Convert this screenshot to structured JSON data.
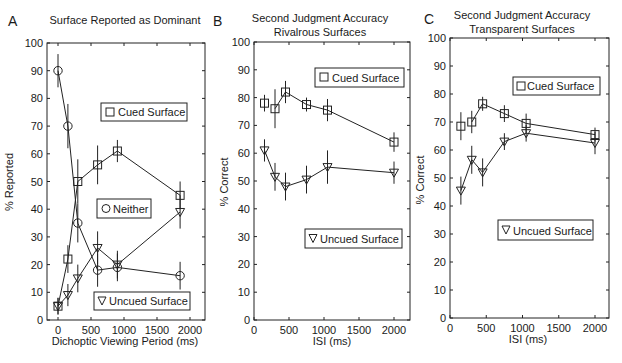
{
  "chart_data": [
    {
      "panel": "A",
      "type": "line",
      "title": "Surface Reported as Dominant",
      "xlabel": "Dichoptic Viewing Period  (ms)",
      "ylabel": "% Reported",
      "xlim": [
        -100,
        2150
      ],
      "ylim": [
        0,
        100
      ],
      "xticks": [
        0,
        500,
        1000,
        1500,
        2000
      ],
      "yticks": [
        0,
        10,
        20,
        30,
        40,
        50,
        60,
        70,
        80,
        90,
        100
      ],
      "grid": false,
      "x": [
        0,
        150,
        300,
        600,
        900,
        1850
      ],
      "series": [
        {
          "name": "Cued Surface",
          "marker": "square",
          "values": [
            5,
            22,
            50,
            56,
            61,
            45
          ],
          "errors": [
            3,
            5,
            8,
            7,
            4,
            5
          ]
        },
        {
          "name": "Neither",
          "marker": "circle",
          "values": [
            90,
            70,
            35,
            18,
            19,
            16
          ],
          "errors": [
            6,
            8,
            7,
            6,
            5,
            5
          ]
        },
        {
          "name": "Uncued Surface",
          "marker": "triangle-down",
          "values": [
            5,
            9,
            15,
            26,
            20,
            39
          ],
          "errors": [
            3,
            4,
            5,
            6,
            5,
            6
          ]
        }
      ],
      "legend": [
        {
          "label": "Cued Surface",
          "marker": "square"
        },
        {
          "label": "Neither",
          "marker": "circle"
        },
        {
          "label": "Uncued Surface",
          "marker": "triangle-down"
        }
      ]
    },
    {
      "panel": "B",
      "type": "line",
      "title": "Second Judgment Accuracy\nRivalrous Surfaces",
      "xlabel": "ISI  (ms)",
      "ylabel": "% Correct",
      "xlim": [
        0,
        2200
      ],
      "ylim": [
        0,
        100
      ],
      "xticks": [
        0,
        500,
        1000,
        1500,
        2000
      ],
      "yticks": [
        0,
        10,
        20,
        30,
        40,
        50,
        60,
        70,
        80,
        90,
        100
      ],
      "grid": false,
      "x": [
        150,
        300,
        450,
        750,
        1050,
        2000
      ],
      "series": [
        {
          "name": "Cued Surface",
          "marker": "square",
          "values": [
            78,
            76,
            82,
            77.5,
            75.5,
            64
          ],
          "errors": [
            3,
            7,
            4,
            2.5,
            4,
            3.5
          ]
        },
        {
          "name": "Uncued Surface",
          "marker": "triangle-down",
          "values": [
            61,
            51.5,
            48,
            50.5,
            55,
            53
          ],
          "errors": [
            4,
            5,
            5,
            5,
            6,
            4
          ]
        }
      ],
      "legend": [
        {
          "label": "Cued Surface",
          "marker": "square"
        },
        {
          "label": "Uncued Surface",
          "marker": "triangle-down"
        }
      ]
    },
    {
      "panel": "C",
      "type": "line",
      "title": "Second Judgment Accuracy\nTransparent Surfaces",
      "xlabel": "ISI  (ms)",
      "ylabel": "% Correct",
      "xlim": [
        0,
        2200
      ],
      "ylim": [
        0,
        100
      ],
      "xticks": [
        0,
        500,
        1000,
        1500,
        2000
      ],
      "yticks": [
        0,
        10,
        20,
        30,
        40,
        50,
        60,
        70,
        80,
        90,
        100
      ],
      "grid": false,
      "x": [
        150,
        300,
        450,
        750,
        1050,
        2000
      ],
      "series": [
        {
          "name": "Cued Surface",
          "marker": "square",
          "values": [
            68.5,
            70,
            76.5,
            73,
            69.5,
            65.5
          ],
          "errors": [
            5,
            4,
            2.5,
            3,
            3.5,
            2.5
          ]
        },
        {
          "name": "Uncued Surface",
          "marker": "triangle-down",
          "values": [
            45.5,
            56.5,
            52,
            63,
            66,
            62.5
          ],
          "errors": [
            5,
            5,
            5,
            3,
            3,
            4
          ]
        }
      ],
      "legend": [
        {
          "label": "Cued Surface",
          "marker": "square"
        },
        {
          "label": "Uncued Surface",
          "marker": "triangle-down"
        }
      ]
    }
  ],
  "panels": {
    "A": {
      "letter": "A",
      "title": "Surface Reported as Dominant",
      "xlabel": "Dichoptic Viewing Period  (ms)",
      "ylabel": "% Reported",
      "legend_cued": "Cued Surface",
      "legend_neither": "Neither",
      "legend_uncued": "Uncued Surface"
    },
    "B": {
      "letter": "B",
      "title_line1": "Second Judgment Accuracy",
      "title_line2": "Rivalrous Surfaces",
      "xlabel": "ISI  (ms)",
      "ylabel": "% Correct",
      "legend_cued": "Cued Surface",
      "legend_uncued": "Uncued Surface"
    },
    "C": {
      "letter": "C",
      "title_line1": "Second Judgment Accuracy",
      "title_line2": "Transparent Surfaces",
      "xlabel": "ISI  (ms)",
      "ylabel": "% Correct",
      "legend_cued": "Cued Surface",
      "legend_uncued": "Uncued Surface"
    }
  },
  "ticks": {
    "y": [
      "0",
      "10",
      "20",
      "30",
      "40",
      "50",
      "60",
      "70",
      "80",
      "90",
      "100"
    ],
    "x": [
      "0",
      "500",
      "1000",
      "1500",
      "2000"
    ]
  }
}
